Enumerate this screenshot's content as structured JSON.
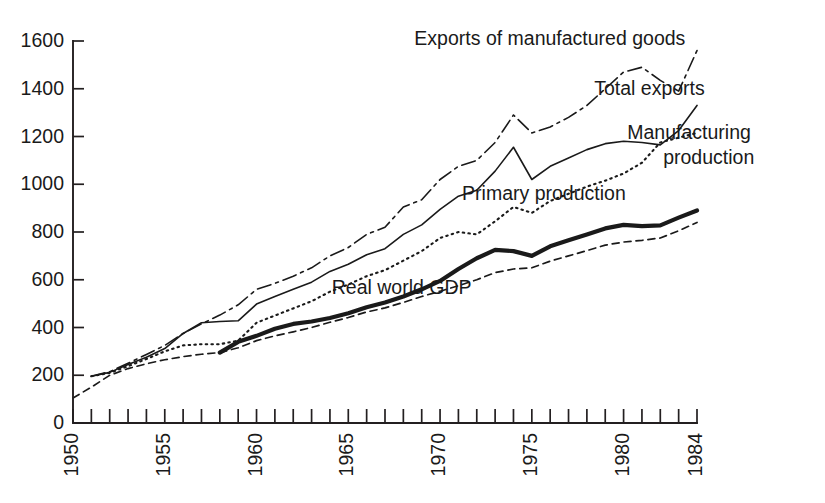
{
  "chart_data": {
    "type": "line",
    "title": "",
    "subtitle": "",
    "xlabel": "",
    "ylabel": "",
    "xlim": [
      1950,
      1984
    ],
    "ylim": [
      0,
      1600
    ],
    "grid": false,
    "legend_position": "inline-annotations",
    "index_note": "Index values, 1950 = 100 for Real world GDP; other series indexed near 200 in early 1950s",
    "yticks": [
      0,
      200,
      400,
      600,
      800,
      1000,
      1200,
      1400,
      1600
    ],
    "ytick_labels": [
      "0",
      "200",
      "400",
      "600",
      "800",
      "1000",
      "1200",
      "1400",
      "1600"
    ],
    "xticks": [
      1950,
      1951,
      1952,
      1953,
      1954,
      1955,
      1956,
      1957,
      1958,
      1959,
      1960,
      1961,
      1962,
      1963,
      1964,
      1965,
      1966,
      1967,
      1968,
      1969,
      1970,
      1971,
      1972,
      1973,
      1974,
      1975,
      1976,
      1977,
      1978,
      1979,
      1980,
      1981,
      1982,
      1983,
      1984
    ],
    "xtick_labels_shown": [
      "1950",
      "1955",
      "1960",
      "1965",
      "1970",
      "1975",
      "1980",
      "1984"
    ],
    "xtick_labels_years": [
      1950,
      1955,
      1960,
      1965,
      1970,
      1975,
      1980,
      1984
    ],
    "xtick_label_rotation": -90,
    "series": [
      {
        "name": "Exports of manufactured goods",
        "style": "dash-dot",
        "stroke_width": 1.6,
        "dasharray": "14 5 3 5",
        "color": "#1a1a1a",
        "label_x": 1968.6,
        "label_y": 1605,
        "label_anchor": "start",
        "label_lines": [
          "Exports of manufactured goods"
        ],
        "x": [
          1951,
          1952,
          1953,
          1954,
          1955,
          1956,
          1957,
          1958,
          1959,
          1960,
          1961,
          1962,
          1963,
          1964,
          1965,
          1966,
          1967,
          1968,
          1969,
          1970,
          1971,
          1972,
          1973,
          1974,
          1975,
          1976,
          1977,
          1978,
          1979,
          1980,
          1981,
          1982,
          1983,
          1984
        ],
        "y": [
          196,
          215,
          250,
          287,
          325,
          375,
          415,
          452,
          495,
          560,
          585,
          615,
          650,
          700,
          735,
          790,
          820,
          905,
          935,
          1020,
          1075,
          1100,
          1175,
          1290,
          1215,
          1240,
          1280,
          1330,
          1400,
          1470,
          1490,
          1435,
          1390,
          1560
        ]
      },
      {
        "name": "Total exports",
        "style": "solid-thin",
        "stroke_width": 1.6,
        "dasharray": "",
        "color": "#1a1a1a",
        "label_x": 1978.4,
        "label_y": 1395,
        "label_anchor": "start",
        "label_lines": [
          "Total exports"
        ],
        "x": [
          1951,
          1952,
          1953,
          1954,
          1955,
          1956,
          1957,
          1958,
          1959,
          1960,
          1961,
          1962,
          1963,
          1964,
          1965,
          1966,
          1967,
          1968,
          1969,
          1970,
          1971,
          1972,
          1973,
          1974,
          1975,
          1976,
          1977,
          1978,
          1979,
          1980,
          1981,
          1982,
          1983,
          1984
        ],
        "y": [
          196,
          212,
          245,
          275,
          312,
          375,
          420,
          425,
          428,
          498,
          530,
          560,
          590,
          635,
          665,
          705,
          730,
          790,
          830,
          895,
          950,
          975,
          1055,
          1155,
          1020,
          1075,
          1110,
          1145,
          1170,
          1180,
          1175,
          1165,
          1225,
          1330
        ]
      },
      {
        "name": "Manufacturing production",
        "style": "dotted",
        "stroke_width": 2.1,
        "dasharray": "1.5 4.2",
        "color": "#1a1a1a",
        "label_x": 1980.2,
        "label_y": 1210,
        "label_anchor": "start",
        "label_lines": [
          "Manufacturing",
          "production"
        ],
        "label_line_anchors": [
          "start",
          "end"
        ],
        "x": [
          1951,
          1952,
          1953,
          1954,
          1955,
          1956,
          1957,
          1958,
          1959,
          1960,
          1961,
          1962,
          1963,
          1964,
          1965,
          1966,
          1967,
          1968,
          1969,
          1970,
          1971,
          1972,
          1973,
          1974,
          1975,
          1976,
          1977,
          1978,
          1979,
          1980,
          1981,
          1982,
          1983,
          1984
        ],
        "y": [
          196,
          210,
          238,
          268,
          300,
          325,
          330,
          330,
          345,
          420,
          450,
          480,
          510,
          550,
          580,
          615,
          640,
          680,
          720,
          775,
          800,
          790,
          845,
          905,
          880,
          930,
          960,
          990,
          1015,
          1045,
          1090,
          1175,
          1195,
          1215
        ]
      },
      {
        "name": "Primary production",
        "style": "solid-thick",
        "stroke_width": 4.2,
        "dasharray": "",
        "color": "#1a1a1a",
        "label_x": 1971.2,
        "label_y": 955,
        "label_anchor": "start",
        "label_lines": [
          "Primary production"
        ],
        "x": [
          1958,
          1959,
          1960,
          1961,
          1962,
          1963,
          1964,
          1965,
          1966,
          1967,
          1968,
          1969,
          1970,
          1971,
          1972,
          1973,
          1974,
          1975,
          1976,
          1977,
          1978,
          1979,
          1980,
          1981,
          1982,
          1983,
          1984
        ],
        "y": [
          295,
          340,
          365,
          395,
          415,
          425,
          440,
          460,
          485,
          505,
          530,
          560,
          595,
          645,
          690,
          725,
          720,
          700,
          740,
          765,
          790,
          815,
          830,
          825,
          828,
          860,
          890
        ]
      },
      {
        "name": "Real world GDP",
        "style": "dashed",
        "stroke_width": 1.7,
        "dasharray": "7 5",
        "color": "#1a1a1a",
        "label_x": 1964.1,
        "label_y": 560,
        "label_anchor": "start",
        "label_lines": [
          "Real world GDP"
        ],
        "x": [
          1950,
          1951,
          1952,
          1953,
          1954,
          1955,
          1956,
          1957,
          1958,
          1959,
          1960,
          1961,
          1962,
          1963,
          1964,
          1965,
          1966,
          1967,
          1968,
          1969,
          1970,
          1971,
          1972,
          1973,
          1974,
          1975,
          1976,
          1977,
          1978,
          1979,
          1980,
          1981,
          1982,
          1983,
          1984
        ],
        "y": [
          105,
          150,
          200,
          228,
          248,
          265,
          278,
          288,
          295,
          315,
          345,
          365,
          382,
          400,
          422,
          442,
          465,
          482,
          505,
          530,
          552,
          575,
          600,
          630,
          645,
          650,
          678,
          700,
          722,
          745,
          758,
          765,
          775,
          805,
          840
        ]
      }
    ]
  }
}
